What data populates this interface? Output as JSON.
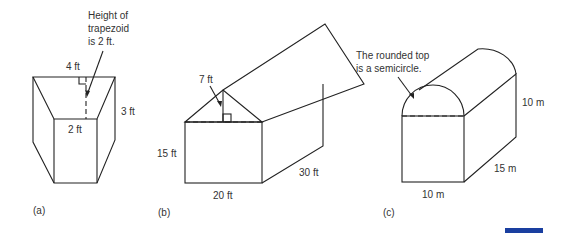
{
  "figures": [
    {
      "id": "a",
      "caption": "(a)",
      "shape": "trapezoidal prism",
      "annotation": [
        "Height of",
        "trapezoid",
        "is 2 ft."
      ],
      "labels": {
        "top": "4 ft",
        "bottom": "2 ft",
        "depth": "3 ft"
      }
    },
    {
      "id": "b",
      "caption": "(b)",
      "shape": "house-shaped prism",
      "labels": {
        "roof_height": "7 ft",
        "wall_height": "15 ft",
        "width": "20 ft",
        "length": "30 ft"
      }
    },
    {
      "id": "c",
      "caption": "(c)",
      "shape": "rectangular prism with semicircular top",
      "annotation": [
        "The rounded top",
        "is a semicircle."
      ],
      "labels": {
        "height": "10 m",
        "width": "10 m",
        "length": "15 m"
      }
    }
  ],
  "colors": {
    "line": "#222222",
    "accent_bar": "#1a3fa0"
  }
}
